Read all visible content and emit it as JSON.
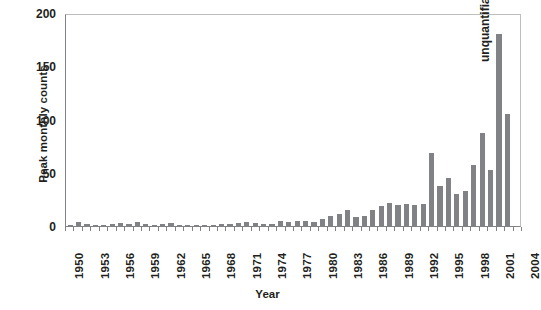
{
  "chart_data": {
    "type": "bar",
    "title": "",
    "xlabel": "Year",
    "ylabel": "Peak monthly counts",
    "ylim": [
      0,
      200
    ],
    "yticks": [
      0,
      50,
      100,
      150,
      200
    ],
    "ytick_labels": [
      "0",
      "50",
      "100",
      "150",
      "200"
    ],
    "xlim": [
      1950,
      2004
    ],
    "xticks": [
      1950,
      1953,
      1956,
      1959,
      1962,
      1965,
      1968,
      1971,
      1974,
      1977,
      1980,
      1983,
      1986,
      1989,
      1992,
      1995,
      1998,
      2001,
      2004
    ],
    "xtick_labels": [
      "1950",
      "1953",
      "1956",
      "1959",
      "1962",
      "1965",
      "1968",
      "1971",
      "1974",
      "1977",
      "1980",
      "1983",
      "1986",
      "1989",
      "1992",
      "1995",
      "1998",
      "2001",
      "2004"
    ],
    "grid": false,
    "legend": null,
    "bar_color": "#808285",
    "categories": [
      1950,
      1951,
      1952,
      1953,
      1954,
      1955,
      1956,
      1957,
      1958,
      1959,
      1960,
      1961,
      1962,
      1963,
      1964,
      1965,
      1966,
      1967,
      1968,
      1969,
      1970,
      1971,
      1972,
      1973,
      1974,
      1975,
      1976,
      1977,
      1978,
      1979,
      1980,
      1981,
      1982,
      1983,
      1984,
      1985,
      1986,
      1987,
      1988,
      1989,
      1990,
      1991,
      1992,
      1993,
      1994,
      1995,
      1996,
      1997,
      1998,
      1999,
      2000,
      2001,
      2002,
      2003
    ],
    "values": [
      1,
      4,
      2,
      1,
      1,
      2,
      3,
      2,
      4,
      2,
      1,
      2,
      3,
      1,
      1,
      1,
      1,
      1,
      2,
      2,
      3,
      4,
      3,
      2,
      2,
      5,
      4,
      5,
      5,
      4,
      7,
      9,
      11,
      15,
      8,
      9,
      15,
      19,
      22,
      20,
      21,
      20,
      21,
      69,
      38,
      45,
      30,
      33,
      57,
      87,
      53,
      180,
      105,
      0
    ],
    "annotations": [
      {
        "text": "unquantifiable",
        "x": 2003,
        "orientation": "vertical"
      }
    ]
  }
}
